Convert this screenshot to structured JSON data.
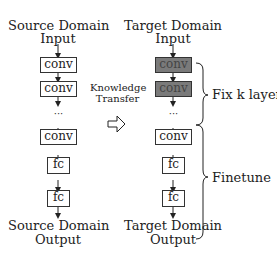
{
  "source": {
    "title_line1": "Source Domain",
    "title_line2": "Input",
    "layers": [
      "conv",
      "conv",
      "conv",
      "fc",
      "fc"
    ],
    "ellipsis": "···",
    "output_line1": "Source Domain",
    "output_line2": "Output"
  },
  "transfer": {
    "line1": "Knowledge",
    "line2": "Transfer",
    "arrow_icon": "⇨"
  },
  "target": {
    "title_line1": "Target Domain",
    "title_line2": "Input",
    "layers": [
      "conv",
      "conv",
      "conv",
      "fc",
      "fc"
    ],
    "fixed_layers": [
      0,
      1
    ],
    "ellipsis": "···",
    "output_line1": "Target Domain",
    "output_line2": "Output"
  },
  "annotations": {
    "fix_label": "Fix k layers",
    "finetune_label": "Finetune"
  },
  "colors": {
    "fixed_fill": "#7a7a7a",
    "stroke": "#333333"
  }
}
